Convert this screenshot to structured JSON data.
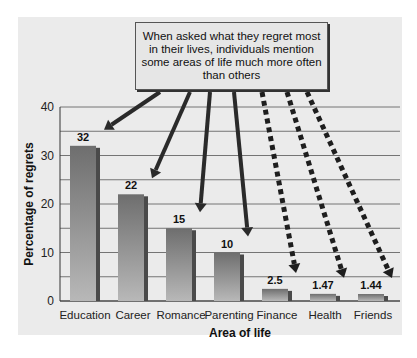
{
  "chart_data": {
    "type": "bar",
    "title": "",
    "xlabel": "Area of life",
    "ylabel": "Percentage of regrets",
    "categories": [
      "Education",
      "Career",
      "Romance",
      "Parenting",
      "Finance",
      "Health",
      "Friends"
    ],
    "values": [
      32,
      22,
      15,
      10,
      2.5,
      1.47,
      1.44
    ],
    "value_labels": [
      "32",
      "22",
      "15",
      "10",
      "2.5",
      "1.47",
      "1.44"
    ],
    "ylim": [
      0,
      40
    ],
    "yticks": [
      0,
      10,
      20,
      30,
      40
    ],
    "grid": true,
    "grid_step": 5,
    "legend": null,
    "annotation": "When asked what they regret most in their lives, individuals mention some areas of life much more often than others",
    "arrow_styles": [
      "solid",
      "solid",
      "solid",
      "solid",
      "dashed",
      "dashed",
      "dashed"
    ]
  },
  "colors": {
    "panel": "#ebebeb",
    "bar_top": "#6e6e6e",
    "bar_bottom": "#b8b8b8",
    "bar_side": "#4a4a4a",
    "grid": "#555555",
    "arrow_solid": "#2a2a2a",
    "arrow_dashed_light": "#9a9a9a",
    "arrow_dashed_dark": "#1e1e1e"
  }
}
